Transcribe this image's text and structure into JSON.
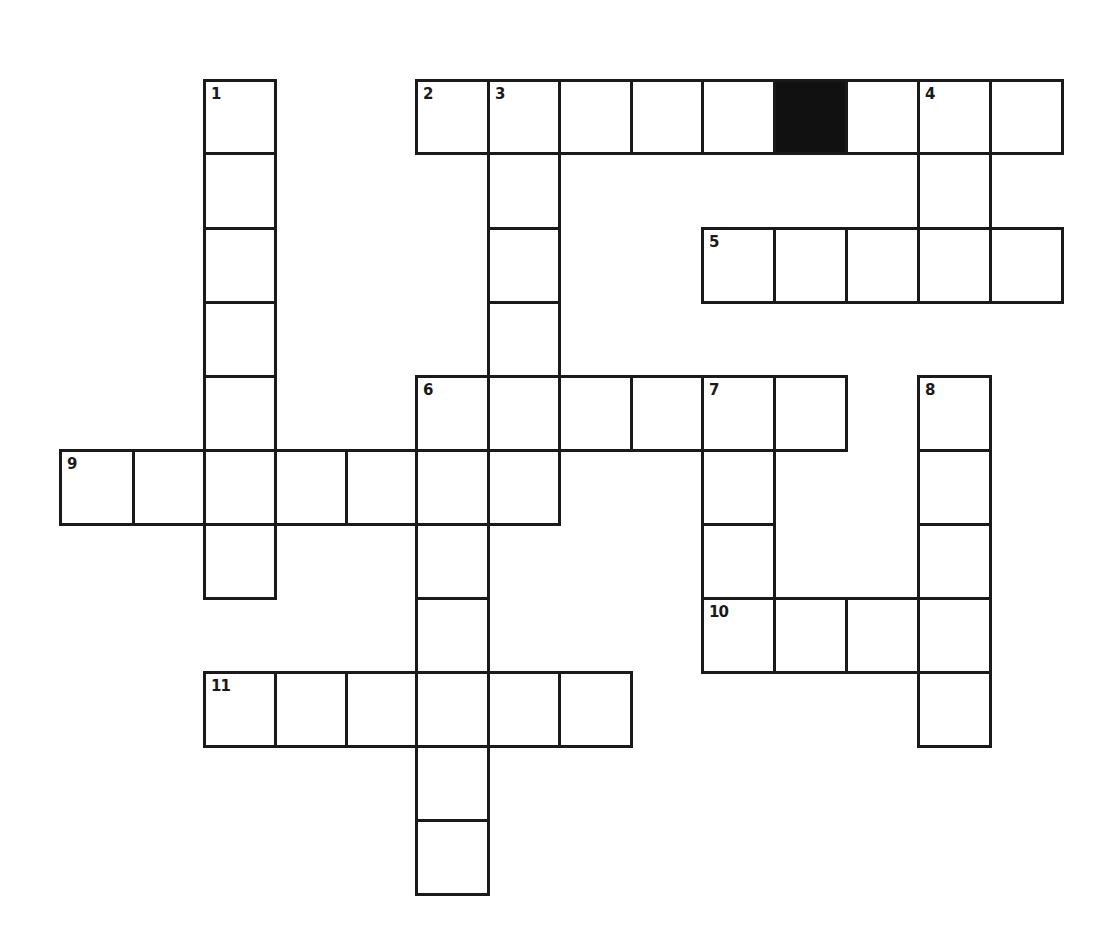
{
  "puzzle": {
    "grid_origin": {
      "x": 60,
      "y": 80
    },
    "col_x": [
      60,
      133,
      204,
      275,
      346,
      416,
      488,
      559,
      631,
      702,
      774,
      846,
      918,
      990,
      1062
    ],
    "row_y": [
      80,
      153,
      228,
      302,
      376,
      450,
      524,
      598,
      672,
      746,
      820,
      894
    ],
    "colors": {
      "border": "#1a1a1a",
      "cell": "#ffffff",
      "block": "#111111",
      "background": "#ffffff"
    },
    "black_cells": [
      [
        0,
        10
      ]
    ],
    "numbers": [
      {
        "label": "1",
        "row": 0,
        "col": 2
      },
      {
        "label": "2",
        "row": 0,
        "col": 5
      },
      {
        "label": "3",
        "row": 0,
        "col": 6
      },
      {
        "label": "4",
        "row": 0,
        "col": 12
      },
      {
        "label": "5",
        "row": 2,
        "col": 9
      },
      {
        "label": "6",
        "row": 4,
        "col": 5
      },
      {
        "label": "7",
        "row": 4,
        "col": 9
      },
      {
        "label": "8",
        "row": 4,
        "col": 12
      },
      {
        "label": "9",
        "row": 5,
        "col": 0
      },
      {
        "label": "10",
        "row": 7,
        "col": 9
      },
      {
        "label": "11",
        "row": 8,
        "col": 2
      }
    ],
    "entries": [
      {
        "id": "1-down",
        "number": "1",
        "direction": "down",
        "row": 0,
        "col": 2,
        "length": 7
      },
      {
        "id": "2-across",
        "number": "2",
        "direction": "across",
        "row": 0,
        "col": 5,
        "length": 9
      },
      {
        "id": "3-down",
        "number": "3",
        "direction": "down",
        "row": 0,
        "col": 6,
        "length": 6
      },
      {
        "id": "4-down",
        "number": "4",
        "direction": "down",
        "row": 0,
        "col": 12,
        "length": 3
      },
      {
        "id": "5-across",
        "number": "5",
        "direction": "across",
        "row": 2,
        "col": 9,
        "length": 5
      },
      {
        "id": "6-across",
        "number": "6",
        "direction": "across",
        "row": 4,
        "col": 5,
        "length": 6
      },
      {
        "id": "6-down",
        "number": "6",
        "direction": "down",
        "row": 4,
        "col": 5,
        "length": 7
      },
      {
        "id": "7-down",
        "number": "7",
        "direction": "down",
        "row": 4,
        "col": 9,
        "length": 4
      },
      {
        "id": "8-down",
        "number": "8",
        "direction": "down",
        "row": 4,
        "col": 12,
        "length": 5
      },
      {
        "id": "9-across",
        "number": "9",
        "direction": "across",
        "row": 5,
        "col": 0,
        "length": 7
      },
      {
        "id": "10-across",
        "number": "10",
        "direction": "across",
        "row": 7,
        "col": 9,
        "length": 4
      },
      {
        "id": "11-across",
        "number": "11",
        "direction": "across",
        "row": 8,
        "col": 2,
        "length": 6
      }
    ],
    "extra_cells": [
      [
        0,
        13
      ]
    ],
    "letters": {}
  }
}
